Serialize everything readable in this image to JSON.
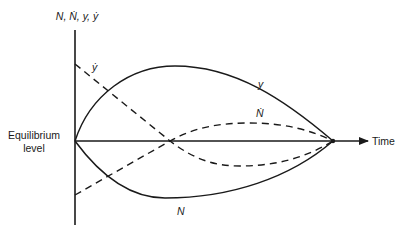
{
  "diagram": {
    "y_axis_label": "N, Ṅ, y, ẏ",
    "x_axis_label": "Time",
    "origin_label_line1": "Equilibrium",
    "origin_label_line2": "level",
    "curves": [
      {
        "name": "y",
        "label": "y",
        "style": "solid",
        "description": "rises from equilibrium to a maximum, then returns to equilibrium"
      },
      {
        "name": "y-dot",
        "label": "ẏ",
        "style": "dashed",
        "description": "starts high, falls through zero, becomes negative and returns to equilibrium"
      },
      {
        "name": "N",
        "label": "N",
        "style": "solid",
        "description": "falls from equilibrium to a minimum, then returns to equilibrium"
      },
      {
        "name": "N-dot",
        "label": "Ṅ",
        "style": "dashed",
        "description": "starts negative, rises through zero, becomes positive and returns to equilibrium"
      }
    ],
    "colors": {
      "line": "#1a1a1a",
      "background": "#ffffff"
    }
  }
}
